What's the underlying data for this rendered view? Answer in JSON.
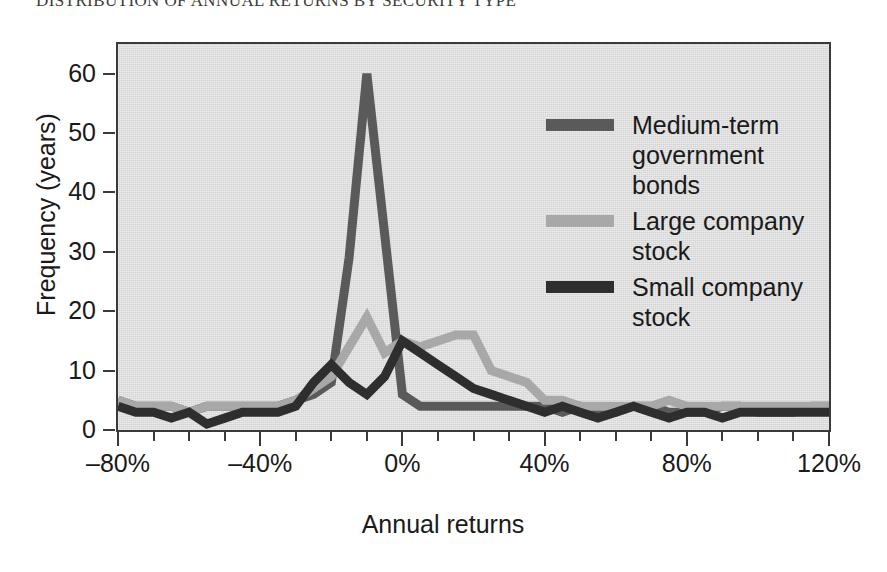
{
  "title": "DISTRIBUTION OF ANNUAL RETURNS BY SECURITY TYPE",
  "axis": {
    "xlabel": "Annual returns",
    "ylabel": "Frequency (years)",
    "yticks": [
      "0",
      "10",
      "20",
      "30",
      "40",
      "50",
      "60"
    ],
    "xticks": [
      "–80%",
      "–40%",
      "0%",
      "40%",
      "80%",
      "120%"
    ]
  },
  "legend": {
    "position": "inside-top-right",
    "items": [
      {
        "label": "Medium-term government bonds",
        "color": "#5a5a5a",
        "key": "medium-term-government-bonds"
      },
      {
        "label": "Large company stock",
        "color": "#a8a8a8",
        "key": "large-company-stock"
      },
      {
        "label": "Small company stock",
        "color": "#2e2e2e",
        "key": "small-company-stock"
      }
    ]
  },
  "colors": {
    "plot_background": "#dcdcdc",
    "frame": "#3a3a3a",
    "page_background": "#ffffff",
    "text": "#1a1a1a"
  },
  "chart_data": {
    "type": "line",
    "title": "DISTRIBUTION OF ANNUAL RETURNS BY SECURITY TYPE",
    "xlabel": "Annual returns",
    "ylabel": "Frequency (years)",
    "xlim": [
      -80,
      120
    ],
    "ylim": [
      0,
      65
    ],
    "xtick_values": [
      -80,
      -40,
      0,
      40,
      80,
      120
    ],
    "xtick_labels": [
      "–80%",
      "–40%",
      "0%",
      "40%",
      "80%",
      "120%"
    ],
    "ytick_values": [
      0,
      10,
      20,
      30,
      40,
      50,
      60
    ],
    "minor_xtick_step": 10,
    "grid": false,
    "legend_position": "inside-top-right",
    "x": [
      -80,
      -75,
      -70,
      -65,
      -60,
      -55,
      -50,
      -45,
      -40,
      -35,
      -30,
      -25,
      -20,
      -15,
      -10,
      -5,
      0,
      5,
      10,
      15,
      20,
      25,
      30,
      35,
      40,
      45,
      50,
      55,
      60,
      65,
      70,
      75,
      80,
      85,
      90,
      95,
      100,
      105,
      110,
      115,
      120
    ],
    "series": [
      {
        "name": "Medium-term government bonds",
        "color": "#5a5a5a",
        "values": [
          5,
          4,
          4,
          4,
          3,
          4,
          4,
          4,
          4,
          4,
          5,
          6,
          8,
          29,
          60,
          33,
          6,
          4,
          4,
          4,
          4,
          4,
          4,
          4,
          4,
          3,
          4,
          3,
          3,
          4,
          4,
          3,
          3,
          3,
          4,
          4,
          3,
          3,
          3,
          4,
          4
        ]
      },
      {
        "name": "Large company stock",
        "color": "#a8a8a8",
        "values": [
          5,
          4,
          4,
          4,
          3,
          4,
          4,
          4,
          4,
          4,
          5,
          7,
          9,
          14,
          19,
          13,
          15,
          14,
          15,
          16,
          16,
          10,
          9,
          8,
          5,
          5,
          4,
          4,
          4,
          4,
          4,
          5,
          4,
          4,
          4,
          4,
          4,
          4,
          4,
          4,
          4
        ]
      },
      {
        "name": "Small company stock",
        "color": "#2e2e2e",
        "values": [
          4,
          3,
          3,
          2,
          3,
          1,
          2,
          3,
          3,
          3,
          4,
          8,
          11,
          8,
          6,
          9,
          15,
          13,
          11,
          9,
          7,
          6,
          5,
          4,
          3,
          4,
          3,
          2,
          3,
          4,
          3,
          2,
          3,
          3,
          2,
          3,
          3,
          3,
          3,
          3,
          3
        ]
      }
    ]
  }
}
